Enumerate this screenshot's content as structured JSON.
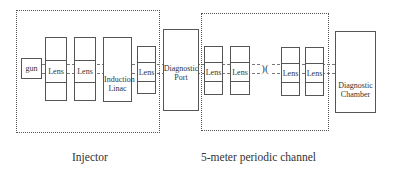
{
  "diagram": {
    "sections": [
      {
        "id": "injector",
        "label": "Injector"
      },
      {
        "id": "channel",
        "label": "5-meter periodic channel"
      }
    ],
    "components": {
      "gun": "gun",
      "lens": "Lens",
      "induction_linac": "Induction Linac",
      "induction_linac_line1": "Induction",
      "induction_linac_line2": "Linac",
      "diagnostic_port_line1": "Diagnostic",
      "diagnostic_port_line2": "Port",
      "diagnostic_chamber_line1": "Diagnostic",
      "diagnostic_chamber_line2": "Chamber",
      "break_symbol": ")("
    },
    "colors": {
      "line": "#555555",
      "background": "#ffffff"
    }
  }
}
